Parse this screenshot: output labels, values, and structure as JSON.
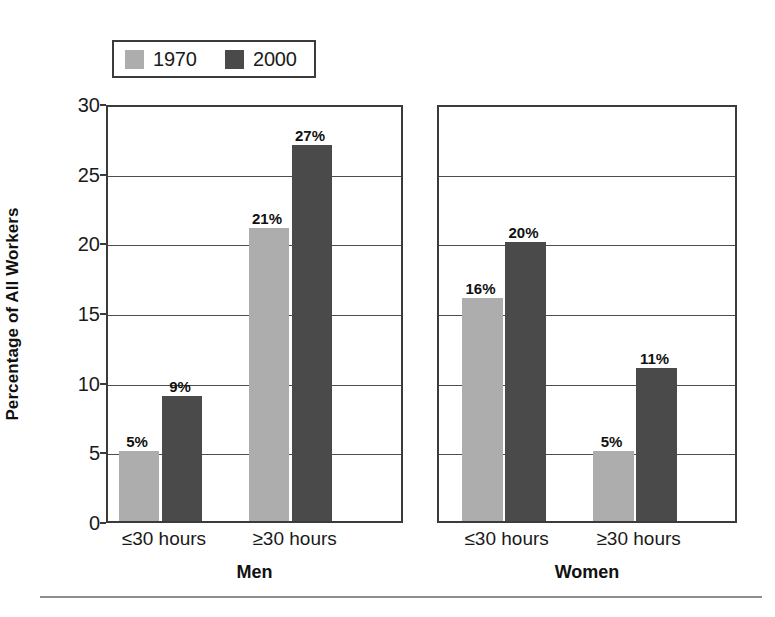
{
  "chart_data": {
    "type": "bar",
    "title": "",
    "xlabel": "",
    "ylabel": "Percentage of All Workers",
    "ylim": [
      0,
      30
    ],
    "yticks": [
      0,
      5,
      10,
      15,
      20,
      25,
      30
    ],
    "grid": true,
    "legend_position": "top-left",
    "value_suffix": "%",
    "categories": [
      "≤30 hours",
      "≥30 hours"
    ],
    "series": [
      {
        "name": "1970",
        "color": "#adadad"
      },
      {
        "name": "2000",
        "color": "#4a4a4a"
      }
    ],
    "panels": [
      {
        "name": "Men",
        "groups": [
          {
            "label": "≤30 hours",
            "bars": [
              {
                "series": "1970",
                "value": 5,
                "label": "5%"
              },
              {
                "series": "2000",
                "value": 9,
                "label": "9%"
              }
            ]
          },
          {
            "label": "≥30 hours",
            "bars": [
              {
                "series": "1970",
                "value": 21,
                "label": "21%"
              },
              {
                "series": "2000",
                "value": 27,
                "label": "27%"
              }
            ]
          }
        ]
      },
      {
        "name": "Women",
        "groups": [
          {
            "label": "≤30 hours",
            "bars": [
              {
                "series": "1970",
                "value": 16,
                "label": "16%"
              },
              {
                "series": "2000",
                "value": 20,
                "label": "20%"
              }
            ]
          },
          {
            "label": "≥30 hours",
            "bars": [
              {
                "series": "1970",
                "value": 5,
                "label": "5%"
              },
              {
                "series": "2000",
                "value": 11,
                "label": "11%"
              }
            ]
          }
        ]
      }
    ]
  },
  "legend": {
    "items": [
      {
        "label": "1970",
        "swatch": "#adadad"
      },
      {
        "label": "2000",
        "swatch": "#4a4a4a"
      }
    ]
  },
  "axis": {
    "ylabel": "Percentage of All Workers",
    "ticks": [
      "30",
      "25",
      "20",
      "15",
      "10",
      "5",
      "0"
    ]
  },
  "panels": [
    {
      "title": "Men",
      "group_labels": [
        "≤30 hours",
        "≥30 hours"
      ]
    },
    {
      "title": "Women",
      "group_labels": [
        "≤30 hours",
        "≥30 hours"
      ]
    }
  ]
}
